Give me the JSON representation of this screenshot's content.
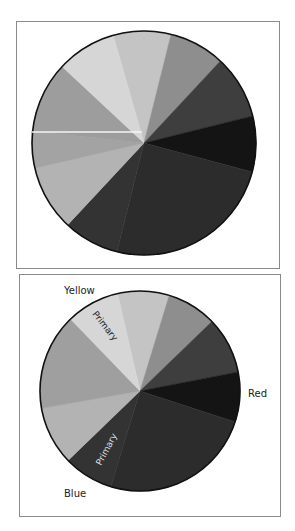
{
  "chart_data": [
    {
      "type": "pie",
      "title": "",
      "center": [
        144,
        143
      ],
      "radius": 112,
      "start_angle_deg": 344,
      "slices": [
        {
          "name": "light-gray-1",
          "value": 30,
          "color": "#c4c4c4"
        },
        {
          "name": "mid-gray",
          "value": 29,
          "color": "#8e8e8e"
        },
        {
          "name": "dark-gray-1",
          "value": 33,
          "color": "#3e3e3e"
        },
        {
          "name": "black",
          "value": 29,
          "color": "#141414"
        },
        {
          "name": "very-dark-1",
          "value": 89,
          "color": "#2c2c2c"
        },
        {
          "name": "very-dark-2",
          "value": 29,
          "color": "#333333"
        },
        {
          "name": "light-gray-2",
          "value": 34,
          "color": "#b3b3b3"
        },
        {
          "name": "gray-2",
          "value": 19,
          "color": "#a3a3a3"
        },
        {
          "name": "gray-3",
          "value": 37,
          "color": "#9d9d9d"
        },
        {
          "name": "lightest",
          "value": 31,
          "color": "#d6d6d6"
        }
      ],
      "annotations": [
        {
          "type": "white-line",
          "y": 132
        }
      ]
    },
    {
      "type": "pie",
      "title": "",
      "center": [
        140,
        391
      ],
      "radius": 100,
      "start_angle_deg": 347,
      "slices": [
        {
          "name": "light-gray-1",
          "value": 30,
          "color": "#c4c4c4"
        },
        {
          "name": "mid-gray",
          "value": 29,
          "color": "#8e8e8e"
        },
        {
          "name": "dark-gray-1",
          "value": 33,
          "color": "#3e3e3e"
        },
        {
          "name": "black",
          "value": 29,
          "color": "#141414"
        },
        {
          "name": "very-dark-1",
          "value": 89,
          "color": "#2c2c2c"
        },
        {
          "name": "very-dark-2",
          "value": 29,
          "color": "#333333"
        },
        {
          "name": "light-gray-2",
          "value": 34,
          "color": "#b3b3b3"
        },
        {
          "name": "gray-2",
          "value": 56,
          "color": "#9f9f9f"
        },
        {
          "name": "lightest",
          "value": 31,
          "color": "#d6d6d6"
        }
      ],
      "labels": [
        {
          "text": "Yellow",
          "x": 64,
          "y": 294
        },
        {
          "text": "Red",
          "x": 248,
          "y": 397
        },
        {
          "text": "Blue",
          "x": 64,
          "y": 497
        }
      ],
      "inner_labels": [
        {
          "text": "Primary",
          "x": 100,
          "y": 320,
          "rotate": 50,
          "color": "#222222"
        },
        {
          "text": "Primary",
          "x": 110,
          "y": 452,
          "rotate": -62,
          "color": "#dddddd"
        }
      ]
    }
  ],
  "labels": {
    "yellow": "Yellow",
    "red": "Red",
    "blue": "Blue",
    "primary_top": "Primary",
    "primary_bottom": "Primary"
  }
}
